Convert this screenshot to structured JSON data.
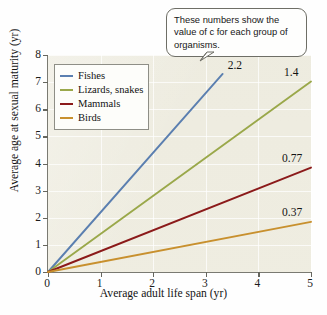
{
  "chart_data": {
    "type": "line",
    "title": "",
    "xlabel": "Average adult life span (yr)",
    "ylabel": "Average age at sexual maturity (yr)",
    "xlim": [
      0,
      5
    ],
    "ylim": [
      0,
      8
    ],
    "xticks": [
      "0",
      "1",
      "2",
      "3",
      "4",
      "5"
    ],
    "yticks": [
      "0",
      "1",
      "2",
      "3",
      "4",
      "5",
      "6",
      "7",
      "8"
    ],
    "grid": true,
    "legend_position": "upper-left-inside",
    "series": [
      {
        "name": "Fishes",
        "slope_label": "2.2",
        "color": "#5b7fb0",
        "x": [
          0,
          3.32
        ],
        "y": [
          0,
          7.3
        ]
      },
      {
        "name": "Lizards, snakes",
        "slope_label": "1.4",
        "color": "#9aa84a",
        "x": [
          0,
          5
        ],
        "y": [
          0,
          7.02
        ]
      },
      {
        "name": "Mammals",
        "slope_label": "0.77",
        "color": "#8b1a1a",
        "x": [
          0,
          5
        ],
        "y": [
          0,
          3.85
        ]
      },
      {
        "name": "Birds",
        "slope_label": "0.37",
        "color": "#c8902e",
        "x": [
          0,
          5
        ],
        "y": [
          0,
          1.85
        ]
      }
    ],
    "annotations": [
      {
        "name": "callout",
        "text": "These numbers show the value of c for each group of organisms."
      }
    ]
  },
  "axes": {
    "x_title": "Average adult life span (yr)",
    "y_title": "Average age at sexual maturity (yr)",
    "x_ticklabels": [
      "0",
      "1",
      "2",
      "3",
      "4",
      "5"
    ],
    "y_ticklabels": [
      "0",
      "1",
      "2",
      "3",
      "4",
      "5",
      "6",
      "7",
      "8"
    ]
  },
  "legend": {
    "items": [
      {
        "label": "Fishes",
        "color": "#5b7fb0"
      },
      {
        "label": "Lizards, snakes",
        "color": "#9aa84a"
      },
      {
        "label": "Mammals",
        "color": "#8b1a1a"
      },
      {
        "label": "Birds",
        "color": "#c8902e"
      }
    ]
  },
  "callout": {
    "text": "These numbers show the value of c for each group of organisms."
  },
  "value_labels": [
    {
      "text": "2.2",
      "series": "Fishes"
    },
    {
      "text": "1.4",
      "series": "Lizards, snakes"
    },
    {
      "text": "0.77",
      "series": "Mammals"
    },
    {
      "text": "0.37",
      "series": "Birds"
    }
  ],
  "colors": {
    "plot_background": "#edebdf",
    "page_background": "#fefefe",
    "axis": "#7a7a72",
    "gridline": "#ffffff",
    "text": "#141414"
  }
}
